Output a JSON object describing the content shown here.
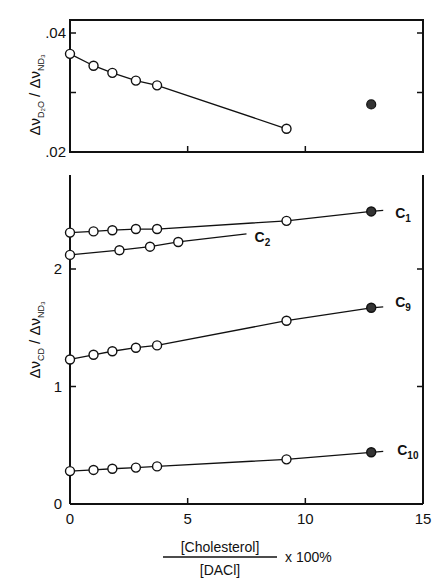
{
  "chart_data": [
    {
      "type": "line",
      "panel": "top",
      "ylabel": "Δν_D2O / Δν_ND3",
      "xlim": [
        0,
        15
      ],
      "ylim": [
        0.02,
        0.042
      ],
      "yticks": [
        ".02",
        ".04"
      ],
      "series": [
        {
          "name": "D2O",
          "x": [
            0,
            1.0,
            1.8,
            2.8,
            3.7,
            9.2
          ],
          "y": [
            0.0365,
            0.0345,
            0.0333,
            0.032,
            0.0312,
            0.0239
          ],
          "marker": "open"
        },
        {
          "name": "D2O-solid",
          "x": [
            12.8
          ],
          "y": [
            0.028
          ],
          "marker": "filled"
        }
      ]
    },
    {
      "type": "line",
      "panel": "bottom",
      "ylabel": "Δν_CD / Δν_ND3",
      "xlabel": "[Cholesterol] / [DACl] x 100%",
      "xlim": [
        0,
        15
      ],
      "ylim": [
        0,
        2.9
      ],
      "xticks": [
        "0",
        "5",
        "10",
        "15"
      ],
      "yticks": [
        "0",
        "1",
        "2"
      ],
      "series": [
        {
          "name": "C1",
          "x": [
            0,
            1.0,
            1.8,
            2.8,
            3.7,
            9.2,
            12.8
          ],
          "y": [
            2.31,
            2.32,
            2.33,
            2.34,
            2.34,
            2.41,
            2.49
          ],
          "solid_last": true
        },
        {
          "name": "C2",
          "x": [
            0,
            2.1,
            3.4,
            4.6
          ],
          "y": [
            2.12,
            2.16,
            2.19,
            2.23
          ],
          "line_end_x": 7.5
        },
        {
          "name": "C9",
          "x": [
            0,
            1.0,
            1.8,
            2.8,
            3.7,
            9.2,
            12.8
          ],
          "y": [
            1.23,
            1.27,
            1.3,
            1.33,
            1.35,
            1.56,
            1.67
          ],
          "solid_last": true
        },
        {
          "name": "C10",
          "x": [
            0,
            1.0,
            1.8,
            2.8,
            3.7,
            9.2,
            12.8
          ],
          "y": [
            0.28,
            0.29,
            0.3,
            0.31,
            0.32,
            0.38,
            0.44
          ],
          "solid_last": true
        }
      ]
    }
  ],
  "labels": {
    "top_ylabel": "Δν",
    "bottom_ylabel": "Δν",
    "xlabel_num": "[Cholesterol]",
    "xlabel_den": "[DACl]",
    "xlabel_suffix": "x 100%",
    "series_labels": [
      "C",
      "C",
      "C",
      "C"
    ],
    "series_subs": [
      "1",
      "2",
      "9",
      "10"
    ]
  }
}
